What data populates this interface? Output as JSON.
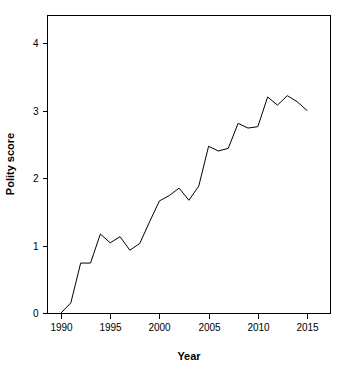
{
  "chart_data": {
    "type": "line",
    "title": "",
    "xlabel": "Year",
    "ylabel": "Polity score",
    "xlim": [
      1989,
      2016
    ],
    "ylim": [
      -0.1,
      4.4
    ],
    "grid": false,
    "legend": null,
    "xticks": [
      1990,
      1995,
      2000,
      2005,
      2010,
      2015
    ],
    "xtick_labels": [
      "1990",
      "1995",
      "2000",
      "2005",
      "2010",
      "2015"
    ],
    "yticks": [
      0,
      1,
      2,
      3,
      4
    ],
    "ytick_labels": [
      "0",
      "1",
      "2",
      "3",
      "4"
    ],
    "series": [
      {
        "name": "Polity score",
        "color": "#000000",
        "x": [
          1990,
          1991,
          1992,
          1993,
          1994,
          1995,
          1996,
          1997,
          1998,
          1999,
          2000,
          2001,
          2002,
          2003,
          2004,
          2005,
          2006,
          2007,
          2008,
          2009,
          2010,
          2011,
          2012,
          2013,
          2014,
          2015
        ],
        "values": [
          0.0,
          0.15,
          0.74,
          0.74,
          1.17,
          1.04,
          1.13,
          0.93,
          1.03,
          1.35,
          1.66,
          1.74,
          1.85,
          1.67,
          1.88,
          2.47,
          2.4,
          2.44,
          2.81,
          2.74,
          2.76,
          3.2,
          3.08,
          3.22,
          3.13,
          3.0
        ]
      }
    ]
  },
  "axes": {
    "x_title": "Year",
    "y_title": "Polity score"
  }
}
